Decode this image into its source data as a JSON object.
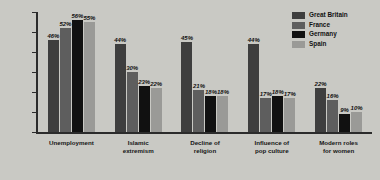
{
  "chart_data": {
    "type": "bar",
    "title": "",
    "xlabel": "",
    "ylabel": "",
    "ylim": [
      0,
      60
    ],
    "grid": false,
    "legend_position": "top-right",
    "y_ticks": [
      "60%",
      "50",
      "40",
      "30",
      "20",
      "10",
      "0"
    ],
    "y_tick_values": [
      60,
      50,
      40,
      30,
      20,
      10,
      0
    ],
    "categories": [
      "Unemployment",
      "Islamic extremism",
      "Decline of religion",
      "Influence of pop culture",
      "Modern roles for women"
    ],
    "category_lines": [
      [
        "Unemployment"
      ],
      [
        "Islamic",
        "extremism"
      ],
      [
        "Decline of",
        "religion"
      ],
      [
        "Influence of",
        "pop culture"
      ],
      [
        "Modern roles",
        "for women"
      ]
    ],
    "series": [
      {
        "name": "Great Britain",
        "color": "#3e3e3e",
        "values": [
          46,
          44,
          45,
          44,
          22
        ],
        "labels": [
          "46%",
          "44%",
          "45%",
          "44%",
          "22%"
        ]
      },
      {
        "name": "France",
        "color": "#5e5e5e",
        "values": [
          52,
          30,
          21,
          17,
          16
        ],
        "labels": [
          "52%",
          "30%",
          "21%",
          "17%",
          "16%"
        ]
      },
      {
        "name": "Germany",
        "color": "#111111",
        "values": [
          56,
          23,
          18,
          18,
          9
        ],
        "labels": [
          "56%",
          "23%",
          "18%",
          "18%",
          "9%"
        ]
      },
      {
        "name": "Spain",
        "color": "#9a9a97",
        "values": [
          55,
          22,
          18,
          17,
          10
        ],
        "labels": [
          "55%",
          "22%",
          "18%",
          "17%",
          "10%"
        ]
      }
    ]
  },
  "legend": {
    "items": [
      {
        "label": "Great Britain",
        "color": "#3e3e3e"
      },
      {
        "label": "France",
        "color": "#5e5e5e"
      },
      {
        "label": "Germany",
        "color": "#111111"
      },
      {
        "label": "Spain",
        "color": "#9a9a97"
      }
    ]
  }
}
